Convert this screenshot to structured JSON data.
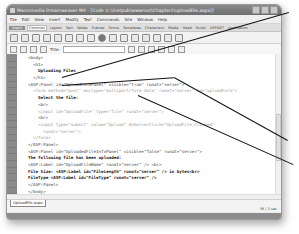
{
  "window": {
    "title": "Macromedia Dreamweaver MX - [Code (c:\\inetpub\\wwwroot\\Chapter2\\uploadFile.aspx)]"
  },
  "menubar": {
    "items": [
      "File",
      "Edit",
      "View",
      "Insert",
      "Modify",
      "Text",
      "Commands",
      "Site",
      "Window",
      "Help"
    ]
  },
  "insertbar": {
    "label": "Insert",
    "tabs": [
      "Common",
      "Layout",
      "Text",
      "Tables",
      "Frames",
      "Forms",
      "Templates",
      "Characters",
      "Media",
      "Head",
      "Script",
      "ASP.NET",
      "Application"
    ],
    "active_tab": "Common"
  },
  "doc_toolbar": {
    "title_label": "Title:",
    "title_value": ""
  },
  "editor": {
    "line_numbers": [
      "",
      "",
      "",
      "",
      "",
      "",
      "",
      "",
      "",
      "",
      "",
      "",
      "",
      "",
      "",
      "",
      "",
      "",
      "",
      "",
      ""
    ],
    "lines": [
      {
        "indent": "  ",
        "text": "<body>",
        "style": "normal"
      },
      {
        "indent": "    ",
        "text": "<h1>",
        "style": "normal"
      },
      {
        "indent": "      ",
        "text": "Uploading Files",
        "style": "bold"
      },
      {
        "indent": "    ",
        "text": "</h1>",
        "style": "normal"
      },
      {
        "indent": "  ",
        "text": "<ASP:Panel id=\"UploadFormPanel\" visible=\"true\" runat=\"server\">",
        "style": "normal"
      },
      {
        "indent": "    ",
        "text": "<form method=\"post\" enctype=\"multipart/form-data\" runat=\"server\" id=\"uploadForm\">",
        "style": "faint"
      },
      {
        "indent": "      ",
        "text": "Select the file:",
        "style": "bold"
      },
      {
        "indent": "      ",
        "text": "<br>",
        "style": "normal"
      },
      {
        "indent": "      ",
        "text": "<input id=\"UploadFile\" type=\"file\" runat=\"server\">",
        "style": "faint"
      },
      {
        "indent": "      ",
        "text": "<br>",
        "style": "normal"
      },
      {
        "indent": "      ",
        "text": "<input type=\"submit\" value=\"Upload\" OnServerClick=\"UploadFile_Clicked\"",
        "style": "faint"
      },
      {
        "indent": "        ",
        "text": "runat=\"server\">",
        "style": "faint"
      },
      {
        "indent": "    ",
        "text": "</form>",
        "style": "faint"
      },
      {
        "indent": "  ",
        "text": "</ASP:Panel>",
        "style": "normal"
      },
      {
        "indent": "  ",
        "text": "<ASP:Panel id=\"UploadedFileInfoPanel\" visible=\"false\" runat=\"server\">",
        "style": "normal"
      },
      {
        "indent": "  ",
        "text": "The following file has been uploaded:",
        "style": "bold"
      },
      {
        "indent": "  ",
        "text": "<ASP:Label id=\"UploadFileName\" runat=\"server\" /> <br>",
        "style": "normal"
      },
      {
        "indent": "  ",
        "text": "File Size: <ASP:Label id=\"FileLength\" runat=\"server\" /> in bytes<br>",
        "style": "bold"
      },
      {
        "indent": "  ",
        "text": "FileType <ASP:Label id=\"FileType\" runat=\"server\" />",
        "style": "bold"
      },
      {
        "indent": "  ",
        "text": "</ASP:Panel>",
        "style": "normal"
      },
      {
        "indent": "  ",
        "text": "</body>",
        "style": "normal"
      },
      {
        "indent": "",
        "text": "</html>",
        "style": "normal"
      }
    ]
  },
  "file_tab": {
    "label": "UploadFile.aspx"
  },
  "statusbar": {
    "size": "3K / 1 sec"
  },
  "properties_bar": {
    "label": "Properties"
  },
  "colors": {
    "titlebar": "#7a7a7a",
    "gutter": "#8a8a8a",
    "callout_line": "#111111"
  }
}
